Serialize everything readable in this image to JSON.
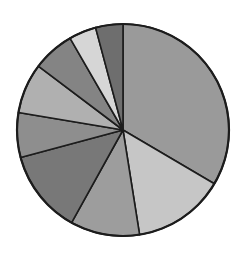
{
  "chart_data": {
    "type": "pie",
    "title": "",
    "subtitle": "",
    "xlabel": "",
    "ylabel": "",
    "grid": false,
    "legend": "none",
    "labels_shown": false,
    "start_angle_deg": 0,
    "direction": "clockwise",
    "center": {
      "x": 123,
      "y": 130
    },
    "radius": 106,
    "edge_color": "#1c1c1c",
    "edge_width": 1.6,
    "background": "#ffffff",
    "total_degrees": 360,
    "categories": [
      "Slice 1",
      "Slice 2",
      "Slice 3",
      "Slice 4",
      "Slice 5",
      "Slice 6",
      "Slice 7",
      "Slice 8",
      "Slice 9"
    ],
    "values": [
      33.5,
      14.0,
      10.6,
      12.8,
      6.8,
      7.6,
      6.4,
      4.2,
      4.1
    ],
    "percentages": [
      33.5,
      14.0,
      10.6,
      12.8,
      6.8,
      7.6,
      6.4,
      4.2,
      4.1
    ],
    "angles_deg": [
      120.5,
      50.5,
      38.0,
      46.0,
      24.5,
      27.5,
      23.0,
      15.0,
      15.0
    ],
    "boundary_angles_deg": [
      0,
      120.5,
      171,
      209,
      255,
      279.5,
      307,
      330,
      345,
      360
    ],
    "colors": [
      "#9a9a9a",
      "#c6c6c6",
      "#9d9d9d",
      "#787878",
      "#8e8e8e",
      "#b0b0b0",
      "#848484",
      "#d6d6d6",
      "#6e6e6e"
    ],
    "slices": [
      {
        "name": "Slice 1",
        "value": 33.5,
        "start_deg": 0,
        "end_deg": 120.5,
        "color": "#9a9a9a"
      },
      {
        "name": "Slice 2",
        "value": 14.0,
        "start_deg": 120.5,
        "end_deg": 171,
        "color": "#c6c6c6"
      },
      {
        "name": "Slice 3",
        "value": 10.6,
        "start_deg": 171,
        "end_deg": 209,
        "color": "#9d9d9d"
      },
      {
        "name": "Slice 4",
        "value": 12.8,
        "start_deg": 209,
        "end_deg": 255,
        "color": "#787878"
      },
      {
        "name": "Slice 5",
        "value": 6.8,
        "start_deg": 255,
        "end_deg": 279.5,
        "color": "#8e8e8e"
      },
      {
        "name": "Slice 6",
        "value": 7.6,
        "start_deg": 279.5,
        "end_deg": 307,
        "color": "#b0b0b0"
      },
      {
        "name": "Slice 7",
        "value": 6.4,
        "start_deg": 307,
        "end_deg": 330,
        "color": "#848484"
      },
      {
        "name": "Slice 8",
        "value": 4.2,
        "start_deg": 330,
        "end_deg": 345,
        "color": "#d6d6d6"
      },
      {
        "name": "Slice 9",
        "value": 4.1,
        "start_deg": 345,
        "end_deg": 360,
        "color": "#6e6e6e"
      }
    ]
  }
}
